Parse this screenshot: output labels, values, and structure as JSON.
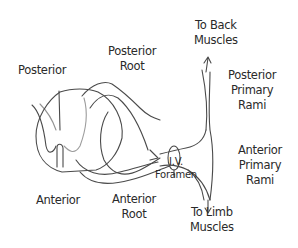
{
  "diagram": {
    "type": "anatomical-line-drawing",
    "stroke_color": "#4a4a4a",
    "text_color": "#2a2a2a",
    "labels": {
      "posterior": "Posterior",
      "anterior": "Anterior",
      "posterior_root": {
        "line1": "Posterior",
        "line2": "Root"
      },
      "anterior_root": {
        "line1": "Anterior",
        "line2": "Root"
      },
      "iv_foramen": {
        "line1": "I.V.",
        "line2": "Foramen"
      },
      "to_back_muscles": {
        "line1": "To Back",
        "line2": "Muscles"
      },
      "to_limb_muscles": {
        "line1": "To Limb",
        "line2": "Muscles"
      },
      "posterior_primary_rami": {
        "line1": "Posterior",
        "line2": "Primary",
        "line3": "Rami"
      },
      "anterior_primary_rami": {
        "line1": "Anterior",
        "line2": "Primary",
        "line3": "Rami"
      }
    },
    "arrows": [
      {
        "name": "up-arrow",
        "direction": "up",
        "target": "To Back Muscles"
      },
      {
        "name": "down-arrow",
        "direction": "down",
        "target": "To Limb Muscles"
      }
    ]
  }
}
